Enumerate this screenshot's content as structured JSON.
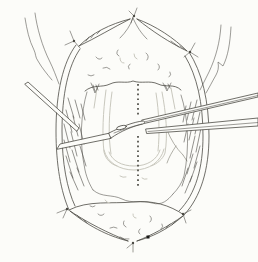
{
  "figure": {
    "alt": "Black-and-white surgical line illustration of an opened midline neck incision: an oval wound with skin flaps reflected upward and downward, each flap corner held by small stay-suture knots (six knots total), hatched cut muscle along both inner wound edges, faint underlying midline structures, a vertical dotted midline marking, a slender probe entering from the upper left, a curved hemostat with an oval eye entering from the left, two long instrument shafts extending to the right edge, and a small black square reference marker near the lower flap tip.",
    "visible_text": "",
    "parts": [
      "neck-contour-left",
      "neck-contour-right",
      "wound-oval-skin-edges",
      "upper-skin-flap",
      "lower-skin-flap",
      "stay-suture-knots",
      "muscle-hatching-left",
      "muscle-hatching-right",
      "faint-deep-structures",
      "small-vein",
      "dotted-midline",
      "probe-instrument",
      "hemostat-instrument",
      "right-instrument-shafts",
      "reference-square-marker"
    ]
  },
  "theme": {
    "paper": "#fcfcf9",
    "ink": "#4b4a44",
    "faint": "#c9c8be",
    "mid": "#8f8e84",
    "marker": "#1a1a18"
  }
}
